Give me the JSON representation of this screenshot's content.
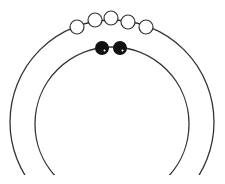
{
  "diagram": {
    "background": "#ffffff",
    "stroke_color": "#333333",
    "outer_arc": {
      "cx": 112,
      "cy": 122,
      "r": 102
    },
    "inner_arc": {
      "cx": 112,
      "cy": 124,
      "r": 77
    },
    "outer_beads": {
      "count": 5,
      "fill": "#ffffff",
      "stroke": "#333333",
      "items": [
        {
          "cx": 77,
          "cy": 27,
          "r": 7
        },
        {
          "cx": 95,
          "cy": 20,
          "r": 7
        },
        {
          "cx": 111,
          "cy": 18,
          "r": 7
        },
        {
          "cx": 128,
          "cy": 22,
          "r": 7
        },
        {
          "cx": 146,
          "cy": 27,
          "r": 7
        }
      ]
    },
    "inner_beads": {
      "count": 2,
      "fill": "#111111",
      "highlight": "#ffffff",
      "items": [
        {
          "cx": 102,
          "cy": 48,
          "r": 7
        },
        {
          "cx": 120,
          "cy": 48,
          "r": 7
        }
      ]
    }
  }
}
